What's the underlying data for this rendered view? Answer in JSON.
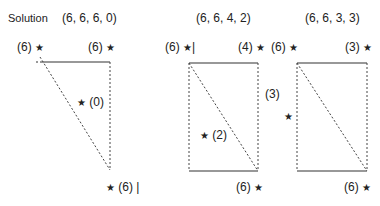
{
  "title": "Solution",
  "panels": [
    {
      "tuple": "(6, 6, 6, 0)",
      "top_left": "(6)",
      "top_right": "(6)",
      "inner": "(0)",
      "bottom_right": "(6)"
    },
    {
      "tuple": "(6, 6, 4, 2)",
      "top_left": "(6)",
      "top_right": "(4)",
      "inner": "(2)",
      "bottom_right": "(6)"
    },
    {
      "tuple": "(6, 6, 3, 3)",
      "top_left": "(6)",
      "top_right": "(3)",
      "left": "(3)",
      "bottom_right": "(6)"
    }
  ],
  "star_glyph": "★",
  "bar_glyph": "|"
}
